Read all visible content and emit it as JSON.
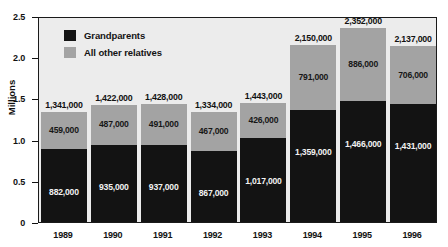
{
  "chart_data": {
    "type": "bar",
    "subtype": "stacked-bar",
    "title": "",
    "xlabel": "",
    "ylabel": "Millions",
    "ylim": [
      0,
      2.5
    ],
    "y_unit_scale": 1000000,
    "grid": false,
    "legend_position": "inside-top-left",
    "categories": [
      "1989",
      "1990",
      "1991",
      "1992",
      "1993",
      "1994",
      "1995",
      "1996"
    ],
    "series": [
      {
        "name": "Grandparents",
        "color": "#131313",
        "values": [
          882000,
          935000,
          937000,
          867000,
          1017000,
          1359000,
          1466000,
          1431000
        ],
        "labels": [
          "882,000",
          "935,000",
          "937,000",
          "867,000",
          "1,017,000",
          "1,359,000",
          "1,466,000",
          "1,431,000"
        ]
      },
      {
        "name": "All other relatives",
        "color": "#a3a3a3",
        "values": [
          459000,
          487000,
          491000,
          467000,
          426000,
          791000,
          886000,
          706000
        ],
        "labels": [
          "459,000",
          "487,000",
          "491,000",
          "467,000",
          "426,000",
          "791,000",
          "886,000",
          "706,000"
        ]
      }
    ],
    "totals": [
      1341000,
      1422000,
      1428000,
      1334000,
      1443000,
      2150000,
      2352000,
      2137000
    ],
    "total_labels": [
      "1,341,000",
      "1,422,000",
      "1,428,000",
      "1,334,000",
      "1,443,000",
      "2,150,000",
      "2,352,000",
      "2,137,000"
    ],
    "y_ticks": [
      {
        "value": 0,
        "label": "0"
      },
      {
        "value": 0.5,
        "label": "0.5"
      },
      {
        "value": 1.0,
        "label": "1.0"
      },
      {
        "value": 1.5,
        "label": "1.5"
      },
      {
        "value": 2.0,
        "label": "2.0"
      },
      {
        "value": 2.5,
        "label": "2.5"
      }
    ]
  },
  "axes": {
    "y_title": "Millions"
  },
  "legend": {
    "items": [
      {
        "label": "Grandparents",
        "swatch": "dark"
      },
      {
        "label": "All other relatives",
        "swatch": "light"
      }
    ]
  },
  "colors": {
    "series_dark": "#131313",
    "series_light": "#a3a3a3",
    "plot_background": "#ececec",
    "plot_border": "#1a1a1a",
    "text": "#111111",
    "page_background": "#ffffff"
  }
}
